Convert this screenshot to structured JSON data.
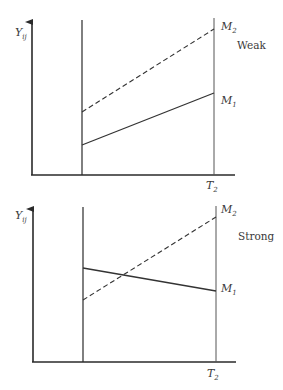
{
  "panels": [
    {
      "name": "weak",
      "title": "Weak",
      "y_label": "Y",
      "y_label_sub": "ij",
      "x_tick_label": "T",
      "x_tick_sub": "2",
      "series": [
        {
          "name": "M2",
          "label": "M",
          "sub": "2",
          "style": "dashed",
          "start": [
            82,
            112
          ],
          "end": [
            214,
            29
          ]
        },
        {
          "name": "M1",
          "label": "M",
          "sub": "1",
          "style": "solid",
          "start": [
            82,
            145
          ],
          "end": [
            214,
            93
          ]
        }
      ]
    },
    {
      "name": "strong",
      "title": "Strong",
      "y_label": "Y",
      "y_label_sub": "ij",
      "x_tick_label": "T",
      "x_tick_sub": "2",
      "series": [
        {
          "name": "M2",
          "label": "M",
          "sub": "2",
          "style": "dashed",
          "start": [
            83,
            300
          ],
          "end": [
            216,
            217
          ]
        },
        {
          "name": "M1",
          "label": "M",
          "sub": "1",
          "style": "solid",
          "start": [
            83,
            268
          ],
          "end": [
            216,
            291
          ]
        }
      ]
    }
  ],
  "colors": {
    "axis": "#2a2a2a",
    "line": "#333333",
    "text": "#3a3a3a"
  }
}
